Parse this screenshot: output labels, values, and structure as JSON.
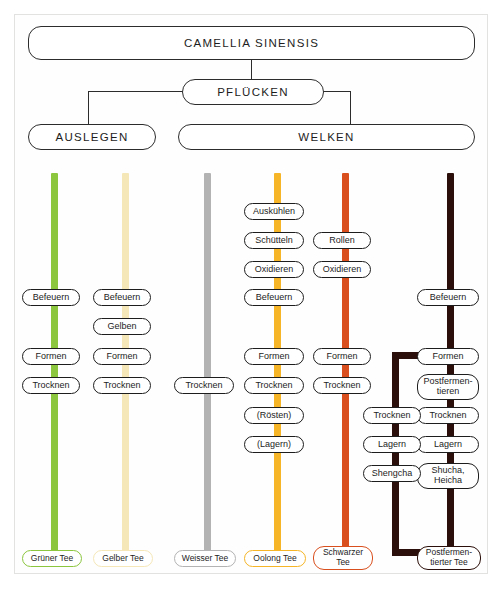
{
  "figure": {
    "background": "#ffffff",
    "frame_color": "#e2e2e0",
    "line_color": "#2c2c2c"
  },
  "header": {
    "root": {
      "label": "CAMELLIA SINENSIS",
      "x": 28,
      "y": 26,
      "w": 447,
      "h": 34
    },
    "pick": {
      "label": "PFLÜCKEN",
      "x": 182,
      "y": 79,
      "w": 142,
      "h": 26
    },
    "spread": {
      "label": "AUSLEGEN",
      "x": 28,
      "y": 124,
      "w": 128,
      "h": 26
    },
    "wither": {
      "label": "WELKEN",
      "x": 178,
      "y": 124,
      "w": 297,
      "h": 26
    }
  },
  "columns": [
    {
      "id": "green",
      "result": "Grüner Tee",
      "color": "#8cc63f",
      "stripe_x": 51,
      "stripe_top": 173,
      "stripe_bottom": 556,
      "pill_x": 22,
      "pill_w": 58,
      "result_x": 22,
      "result_w": 60,
      "steps": [
        {
          "label": "Befeuern",
          "y": 289
        },
        {
          "label": "Formen",
          "y": 348
        },
        {
          "label": "Trocknen",
          "y": 377
        }
      ]
    },
    {
      "id": "yellow",
      "result": "Gelber Tee",
      "color": "#f5e7b8",
      "stripe_x": 122,
      "stripe_top": 173,
      "stripe_bottom": 556,
      "pill_x": 93,
      "pill_w": 58,
      "result_x": 93,
      "result_w": 60,
      "steps": [
        {
          "label": "Befeuern",
          "y": 289
        },
        {
          "label": "Gelben",
          "y": 318
        },
        {
          "label": "Formen",
          "y": 348
        },
        {
          "label": "Trocknen",
          "y": 377
        }
      ]
    },
    {
      "id": "white",
      "result": "Weisser Tee",
      "color": "#b3b3b3",
      "stripe_x": 204,
      "stripe_top": 173,
      "stripe_bottom": 556,
      "pill_x": 174,
      "pill_w": 60,
      "result_x": 174,
      "result_w": 62,
      "steps": [
        {
          "label": "Trocknen",
          "y": 377
        }
      ]
    },
    {
      "id": "oolong",
      "result": "Oolong Tee",
      "color": "#f5b527",
      "stripe_x": 274,
      "stripe_top": 173,
      "stripe_bottom": 556,
      "pill_x": 244,
      "pill_w": 60,
      "result_x": 244,
      "result_w": 62,
      "steps": [
        {
          "label": "Auskühlen",
          "y": 203
        },
        {
          "label": "Schütteln",
          "y": 232
        },
        {
          "label": "Oxidieren",
          "y": 261
        },
        {
          "label": "Befeuern",
          "y": 289
        },
        {
          "label": "Formen",
          "y": 348
        },
        {
          "label": "Trocknen",
          "y": 377
        },
        {
          "label": "(Rösten)",
          "y": 407
        },
        {
          "label": "(Lagern)",
          "y": 436
        }
      ]
    },
    {
      "id": "black",
      "result": "Schwarzer\nTee",
      "color": "#d94f1e",
      "stripe_x": 342,
      "stripe_top": 173,
      "stripe_bottom": 556,
      "pill_x": 313,
      "pill_w": 58,
      "result_x": 313,
      "result_w": 60,
      "steps": [
        {
          "label": "Rollen",
          "y": 232
        },
        {
          "label": "Oxidieren",
          "y": 261
        },
        {
          "label": "Formen",
          "y": 348
        },
        {
          "label": "Trocknen",
          "y": 377
        }
      ]
    },
    {
      "id": "postfermented",
      "result": "Postfermen-\ntierter Tee",
      "color": "#2b0f0a",
      "stripe_x": 447,
      "stripe_top": 173,
      "stripe_bottom": 556,
      "pill_x": 417,
      "pill_w": 62,
      "result_x": 417,
      "result_w": 64,
      "steps": [
        {
          "label": "Befeuern",
          "y": 289
        },
        {
          "label": "Formen",
          "y": 348
        },
        {
          "label": "Postfermen-\ntieren",
          "y": 374
        },
        {
          "label": "Trocknen",
          "y": 407
        },
        {
          "label": "Lagern",
          "y": 436
        },
        {
          "label": "Shucha,\nHeicha",
          "y": 463
        }
      ]
    },
    {
      "id": "postfermented-branch",
      "result": "",
      "color": "#2b0f0a",
      "stripe_x": 392,
      "stripe_top": 356,
      "stripe_bottom": 556,
      "pill_x": 363,
      "pill_w": 58,
      "result_x": 0,
      "result_w": 0,
      "steps": [
        {
          "label": "Trocknen",
          "y": 407
        },
        {
          "label": "Lagern",
          "y": 436
        },
        {
          "label": "Shengcha",
          "y": 465
        }
      ]
    }
  ],
  "branch_segments": [
    {
      "name": "postferment-branch-top",
      "x": 392,
      "y": 352,
      "w": 58,
      "h": 7
    },
    {
      "name": "postferment-branch-bottom",
      "x": 392,
      "y": 549,
      "w": 58,
      "h": 7
    }
  ],
  "connectors": [
    {
      "name": "root-to-pick",
      "x": 251,
      "y": 60,
      "w": 1.4,
      "h": 19
    },
    {
      "name": "pick-left-horizontal",
      "x": 88,
      "y": 91,
      "w": 95,
      "h": 1.4
    },
    {
      "name": "pick-left-vertical",
      "x": 88,
      "y": 91,
      "w": 1.4,
      "h": 33
    },
    {
      "name": "pick-right-horizontal",
      "x": 323,
      "y": 91,
      "w": 28,
      "h": 1.4
    },
    {
      "name": "pick-right-vertical",
      "x": 350,
      "y": 91,
      "w": 1.4,
      "h": 33
    }
  ]
}
